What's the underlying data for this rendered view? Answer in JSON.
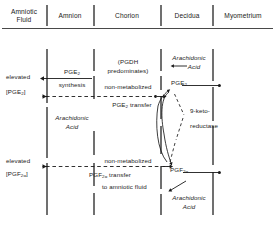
{
  "diagram": {
    "title_visible": false,
    "columns": [
      {
        "id": "amniotic-fluid",
        "label": "Amniotic\nFluid",
        "line1": "Amniotic",
        "line2": "Fluid"
      },
      {
        "id": "amnion",
        "label": "Amnion",
        "line1": "Amnion",
        "line2": ""
      },
      {
        "id": "chorion",
        "label": "Chorion",
        "line1": "Chorion",
        "line2": ""
      },
      {
        "id": "decidua",
        "label": "Decidua",
        "line1": "Decidua",
        "line2": ""
      },
      {
        "id": "myometrium",
        "label": "Myometrium",
        "line1": "Myometrium",
        "line2": ""
      }
    ],
    "labels": {
      "elevated_pge2_1": "elevated",
      "elevated_pge2_2": "[PGE",
      "elevated_pge2_sub": "2",
      "elevated_pge2_3": "]",
      "pge2_synthesis_1": "PGE",
      "pge2_synthesis_sub": "2",
      "pge2_synthesis_2": "synthesis",
      "pgdh_1": "(PGDH",
      "pgdh_2": "predominates)",
      "non_metabolized_top": "non-metabolized",
      "pge2_transfer_1": "PGE",
      "pge2_transfer_sub": "2",
      "pge2_transfer_2": " transfer",
      "arachidonic_amnion_1": "Arachidonic",
      "arachidonic_amnion_2": "Acid",
      "arachidonic_decidua_top_1": "Arachidonic",
      "arachidonic_decidua_top_2": "Acid",
      "pge2_decidua": "PGE",
      "pge2_decidua_sub": "2",
      "nine_keto_1": "9-keto-",
      "nine_keto_2": "reductase",
      "elevated_pgf_1": "elevated",
      "elevated_pgf_2": "[PGF",
      "elevated_pgf_sub": "2α",
      "elevated_pgf_3": "]",
      "non_metabolized_bottom": "non-metabolized",
      "pgf_transfer_1": "PGF",
      "pgf_transfer_sub": "2α",
      "pgf_transfer_2": " transfer",
      "to_amniotic_fluid": "to amniotic fluid",
      "pgf_decidua": "PGF",
      "pgf_decidua_sub": "2α",
      "arachidonic_decidua_bottom_1": "Arachidonic",
      "arachidonic_decidua_bottom_2": "Acid"
    },
    "colors": {
      "ink": "#1a1a1a",
      "background": "#ffffff"
    }
  }
}
